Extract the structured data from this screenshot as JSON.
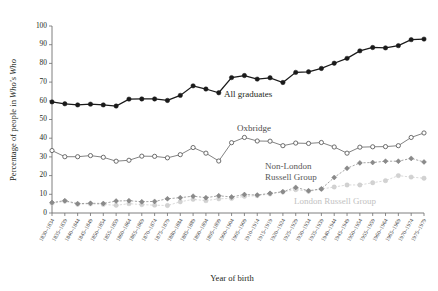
{
  "chart_data": {
    "type": "line",
    "title": "",
    "xlabel": "Year of birth",
    "ylabel_parts": {
      "pre": "Percentage of people in ",
      "italic": "Who's Who"
    },
    "ylabel": "Percentage of people in Who's Who",
    "ylim": [
      0,
      100
    ],
    "yticks": [
      0,
      10,
      20,
      30,
      40,
      50,
      60,
      70,
      80,
      90,
      100
    ],
    "grid": false,
    "legend_position": "inline-annotations",
    "categories": [
      "1830–1834",
      "1835–1839",
      "1840–1844",
      "1845–1849",
      "1850–1854",
      "1855–1859",
      "1860–1864",
      "1865–1869",
      "1870–1874",
      "1875–1879",
      "1880–1884",
      "1885–1889",
      "1890–1894",
      "1895–1899",
      "1900–1904",
      "1905–1909",
      "1910–1914",
      "1915–1919",
      "1920–1924",
      "1925–1929",
      "1930–1934",
      "1935–1939",
      "1940–1944",
      "1945–1949",
      "1950–1954",
      "1955–1959",
      "1960–1964",
      "1965–1969",
      "1970–1974",
      "1975–1979"
    ],
    "series": [
      {
        "name": "All graduates",
        "color": "#1a1a1a",
        "marker": "filled-circle",
        "line_style": "solid",
        "values": [
          59.4,
          58.4,
          57.8,
          58.2,
          57.8,
          57.2,
          60.9,
          61.0,
          61.0,
          60.2,
          62.9,
          68.0,
          66.3,
          64.3,
          72.4,
          73.5,
          71.6,
          72.3,
          69.8,
          75.2,
          75.5,
          77.3,
          80.1,
          82.7,
          86.7,
          88.5,
          88.3,
          89.5,
          92.7,
          93.0
        ]
      },
      {
        "name": "Oxbridge",
        "color": "#5d5d5d",
        "marker": "open-circle",
        "line_style": "solid",
        "values": [
          33.4,
          30.1,
          30.1,
          30.7,
          29.8,
          27.7,
          28.2,
          30.4,
          30.3,
          29.5,
          31.2,
          35.0,
          32.0,
          27.8,
          37.6,
          40.4,
          38.5,
          38.4,
          36.0,
          37.4,
          37.2,
          37.7,
          35.3,
          32.0,
          35.2,
          35.4,
          35.5,
          36.0,
          40.4,
          42.8
        ]
      },
      {
        "name": "Non-London Russell Group",
        "color": "#8a8a8a",
        "marker": "filled-diamond",
        "line_style": "dashed",
        "values": [
          5.6,
          6.6,
          5.0,
          5.2,
          5.1,
          6.4,
          6.6,
          6.0,
          6.2,
          7.6,
          8.2,
          9.0,
          8.2,
          9.2,
          8.6,
          9.9,
          9.6,
          10.5,
          11.4,
          13.7,
          11.9,
          12.9,
          19.0,
          23.9,
          26.8,
          27.0,
          27.7,
          27.7,
          29.2,
          27.3
        ]
      },
      {
        "name": "London Russell Group",
        "color": "#d2d2d2",
        "marker": "filled-circle",
        "line_style": "dashed",
        "values": [
          5.2,
          6.3,
          4.7,
          4.9,
          4.6,
          4.1,
          5.0,
          4.5,
          4.2,
          4.0,
          6.0,
          7.3,
          6.6,
          7.6,
          7.8,
          8.9,
          9.3,
          10.2,
          11.2,
          12.5,
          11.6,
          12.8,
          13.9,
          15.0,
          15.0,
          16.2,
          17.3,
          20.0,
          19.2,
          18.6
        ]
      }
    ],
    "annotations": [
      {
        "text": "All graduates",
        "series": "All graduates"
      },
      {
        "text": "Oxbridge",
        "series": "Oxbridge"
      },
      {
        "text": "Non-London",
        "series": "Non-London Russell Group"
      },
      {
        "text": "Russell Group",
        "series": "Non-London Russell Group"
      },
      {
        "text": "London Russell Group",
        "series": "London Russell Group"
      }
    ]
  }
}
